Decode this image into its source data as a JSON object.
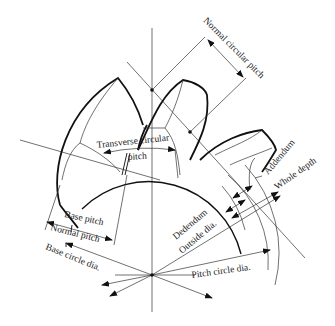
{
  "diagram": {
    "line_color": "#222222",
    "background": "#ffffff",
    "labels": {
      "normal_circular_pitch": "Normal circular pitch",
      "transverse_circular_pitch_line1": "Transverse circular",
      "transverse_circular_pitch_line2": "pitch",
      "addendum": "Addendum",
      "whole_depth": "Whole depth",
      "dedendum": "Dedendum",
      "outside_dia": "Outside dia.",
      "base_pitch": "Base pitch",
      "normal_pitch": "Normal pitch",
      "base_circle_dia": "Base circle dia.",
      "pitch_circle_dia": "Pitch circle dia."
    }
  }
}
